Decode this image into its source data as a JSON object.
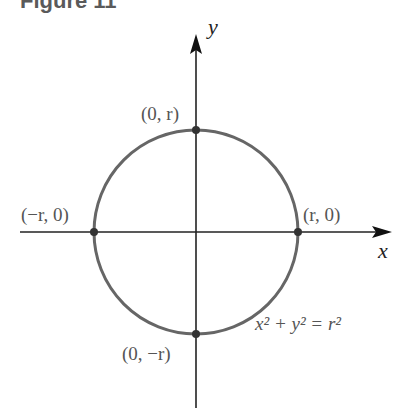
{
  "figure": {
    "title": "Figure 11",
    "x_axis_label": "x",
    "y_axis_label": "y",
    "equation": "x² + y² = r²",
    "points": [
      {
        "label": "(0, r)",
        "name": "top"
      },
      {
        "label": "(−r, 0)",
        "name": "left"
      },
      {
        "label": "(r, 0)",
        "name": "right"
      },
      {
        "label": "(0, −r)",
        "name": "bottom"
      }
    ],
    "colors": {
      "circle": "#666666",
      "axes": "#222222",
      "labels": "#555555"
    }
  }
}
